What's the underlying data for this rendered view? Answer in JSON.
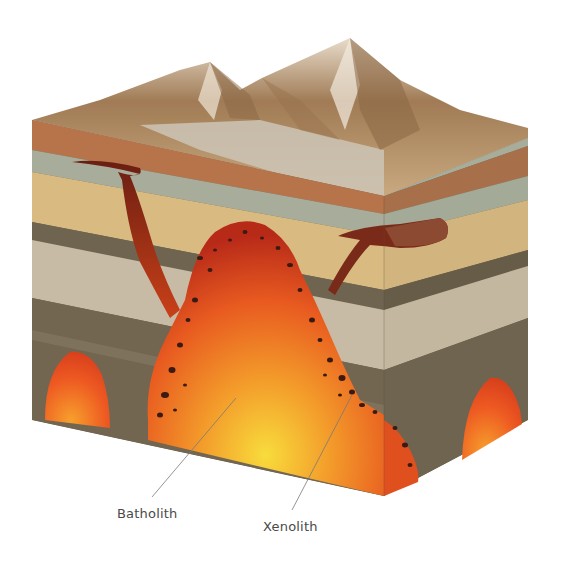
{
  "diagram": {
    "labels": [
      {
        "id": "batholith",
        "text": "Batholith"
      },
      {
        "id": "xenolith",
        "text": "Xenolith"
      }
    ],
    "colors": {
      "magma_core": "#f7d23a",
      "magma_mid": "#f07a22",
      "magma_edge": "#c9321e",
      "dike": "#7a2414",
      "sill": "#8c4a32",
      "mountain": "#a8835c",
      "layer_rust": "#b7744a",
      "layer_sage": "#a7ad9a",
      "layer_sand": "#d9bb82",
      "layer_dark": "#6e6450",
      "layer_pale": "#c8bba5",
      "leader_line": "#7a7a7a"
    }
  }
}
